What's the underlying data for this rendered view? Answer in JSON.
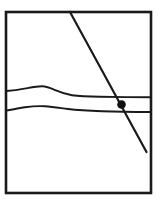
{
  "figure": {
    "title": "",
    "caption": "",
    "background_color": "#ffffff",
    "stroke_color": "#1a1a1a",
    "marker_color": "#111111"
  },
  "frame": {
    "name": "rectangular-panel-border",
    "x": 6,
    "y": 12,
    "width": 145,
    "height": 181,
    "stroke_width": 2.6,
    "fill": "none"
  },
  "layers": [
    {
      "name": "upper-boundary-curve",
      "label": "",
      "stroke_width": 1.9,
      "path": "M 6.5,91 C 14,90.5 20,89.5 26,88.4 C 32,87.3 37,86.3 42,86.3 C 47,86.3 51,88.2 56,90.4 C 61,92.6 66,94.3 72,95.2 C 80,96.3 90,96.6 100,96.8 C 115,97.1 135,97.2 150.5,97.3"
    },
    {
      "name": "lower-boundary-curve",
      "label": "",
      "stroke_width": 1.9,
      "path": "M 6.5,110.5 C 13,109.4 19,108.2 25,107.3 C 32,106.3 38,105.9 45,106.3 C 53,106.8 60,108 68,109 C 78,110.2 90,110.8 102,111.2 C 118,111.7 136,111.9 150.5,112"
    }
  ],
  "fault_line": {
    "name": "diagonal-fault-line",
    "label": "",
    "stroke_width": 2.2,
    "x1": 70,
    "y1": 12,
    "x2": 146.5,
    "y2": 152
  },
  "marker": {
    "name": "intersection-point-marker",
    "label": "",
    "cx": 121.5,
    "cy": 104.5,
    "r": 4.3
  },
  "chart_data": {
    "type": "diagram",
    "elements": [
      "rectangular-panel-border",
      "upper-boundary-curve",
      "lower-boundary-curve",
      "diagonal-fault-line",
      "intersection-point-marker"
    ]
  }
}
